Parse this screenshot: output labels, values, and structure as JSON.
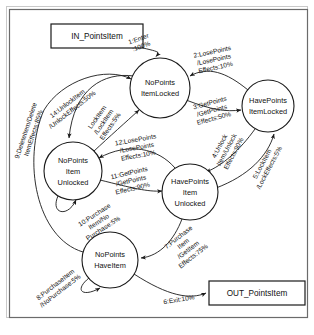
{
  "diagram": {
    "type": "state-machine",
    "frame": {
      "border_color": "#6b6b6b",
      "background": "#ffffff"
    },
    "terminals": [
      {
        "id": "in",
        "label": "IN_PointsItem",
        "x": 97,
        "y": 36,
        "w": 92,
        "h": 24
      },
      {
        "id": "out",
        "label": "OUT_PointsItem",
        "x": 257,
        "y": 293,
        "w": 96,
        "h": 24
      }
    ],
    "states": [
      {
        "id": "s_np_locked",
        "lines": [
          "NoPoints",
          "ItemLocked"
        ],
        "cx": 160,
        "cy": 88,
        "r": 30
      },
      {
        "id": "s_hp_locked",
        "lines": [
          "HavePoints",
          "ItemLocked"
        ],
        "cx": 268,
        "cy": 106,
        "r": 26
      },
      {
        "id": "s_np_unlocked",
        "lines": [
          "NoPoints",
          "Item",
          "Unlocked"
        ],
        "cx": 73,
        "cy": 171,
        "r": 29
      },
      {
        "id": "s_hp_unlocked",
        "lines": [
          "HavePoints",
          "Item",
          "Unlocked"
        ],
        "cx": 190,
        "cy": 192,
        "r": 28
      },
      {
        "id": "s_np_haveitem",
        "lines": [
          "NoPoints",
          "HaveItem"
        ],
        "cx": 110,
        "cy": 260,
        "r": 28
      }
    ],
    "transitions": [
      {
        "id": "t1",
        "number": "1",
        "from": "in",
        "to": "s_np_locked",
        "lines": [
          "1:Enter",
          ":100%"
        ],
        "label_x": 140,
        "label_y": 43,
        "rotation": -20,
        "trigger": "Enter",
        "probability": "100%"
      },
      {
        "id": "t2",
        "number": "2",
        "from": "s_hp_locked",
        "to": "s_np_locked",
        "lines": [
          "2:LosePoints",
          "/LosePoints",
          "Effects:10%"
        ],
        "label_x": 214,
        "label_y": 60,
        "rotation": -12,
        "trigger": "LosePoints",
        "action": "LosePoints",
        "probability": "10%"
      },
      {
        "id": "t3",
        "number": "3",
        "from": "s_np_locked",
        "to": "s_hp_locked",
        "lines": [
          "3:GetPoints",
          "/GetPoints",
          "Effects:50%"
        ],
        "label_x": 214,
        "label_y": 110,
        "rotation": -15,
        "trigger": "GetPoints",
        "action": "GetPoints",
        "probability": "50%"
      },
      {
        "id": "t4",
        "number": "4",
        "from": "s_hp_locked",
        "to": "s_hp_unlocked",
        "lines": [
          "4:Unlock",
          "Item/Unlock",
          "Effects:90%"
        ],
        "label_x": 224,
        "label_y": 150,
        "rotation": -62,
        "trigger": "UnlockItem",
        "action": "Unlock",
        "probability": "90%"
      },
      {
        "id": "t5",
        "number": "5",
        "from": "s_hp_unlocked",
        "to": "s_hp_locked",
        "lines": [
          "5:LockItem",
          "/LockEffects:5%"
        ],
        "label_x": 266,
        "label_y": 166,
        "rotation": -62,
        "trigger": "LockItem",
        "action": "Lock",
        "probability": "5%"
      },
      {
        "id": "t6",
        "number": "6",
        "from": "s_np_haveitem",
        "to": "out",
        "lines": [
          "6:Exit:10%"
        ],
        "label_x": 179,
        "label_y": 300,
        "rotation": -9,
        "trigger": "Exit",
        "probability": "10%"
      },
      {
        "id": "t7",
        "number": "7",
        "from": "s_hp_unlocked",
        "to": "s_np_haveitem",
        "lines": [
          "7:Purchase",
          "Item",
          "/GetItem",
          "Effects:75%"
        ],
        "label_x": 183,
        "label_y": 248,
        "rotation": -38,
        "trigger": "PurchaseItem",
        "action": "GetItem",
        "probability": "75%"
      },
      {
        "id": "t8",
        "number": "8",
        "from": "s_np_haveitem",
        "to": "s_np_haveitem",
        "lines": [
          "8:PurchaseItem",
          "/NoPurchase:5%"
        ],
        "label_x": 58,
        "label_y": 288,
        "rotation": -38,
        "trigger": "PurchaseItem",
        "action": "NoPurchase",
        "probability": "5%"
      },
      {
        "id": "t9",
        "number": "9",
        "from": "s_np_haveitem",
        "to": "s_np_locked",
        "lines": [
          "9:DeleteItem/Delete",
          "ItemEffects:85%"
        ],
        "label_x": 28,
        "label_y": 132,
        "rotation": -72,
        "trigger": "DeleteItem",
        "action": "DeleteItem",
        "probability": "85%"
      },
      {
        "id": "t10",
        "number": "10",
        "from": "s_np_unlocked",
        "to": "s_np_unlocked",
        "lines": [
          "10:Purchase",
          "Item/No",
          "Purchase:5%"
        ],
        "label_x": 98,
        "label_y": 222,
        "rotation": -33,
        "trigger": "PurchaseItem",
        "action": "NoPurchase",
        "probability": "5%"
      },
      {
        "id": "t11",
        "number": "11",
        "from": "s_np_unlocked",
        "to": "s_hp_unlocked",
        "lines": [
          "11:GetPoints",
          "/GetPoints",
          "Effects:90%"
        ],
        "label_x": 131,
        "label_y": 180,
        "rotation": -13,
        "trigger": "GetPoints",
        "action": "GetPoints",
        "probability": "90%"
      },
      {
        "id": "t12",
        "number": "12",
        "from": "s_hp_unlocked",
        "to": "s_np_unlocked",
        "lines": [
          "12:LosePoints",
          "/LosePoints",
          "Effects:10%"
        ],
        "label_x": 136,
        "label_y": 148,
        "rotation": -10,
        "trigger": "LosePoints",
        "action": "LosePoints",
        "probability": "10%"
      },
      {
        "id": "t13",
        "number": "13",
        "from": "s_np_unlocked",
        "to": "s_np_locked",
        "lines": [
          "LockItem",
          "/LockItem",
          "Effects:5%"
        ],
        "label_x": 102,
        "label_y": 122,
        "rotation": -58,
        "trigger": "LockItem",
        "action": "LockItem",
        "probability": "5%"
      },
      {
        "id": "t14",
        "number": "14",
        "from": "s_np_locked",
        "to": "s_np_unlocked",
        "lines": [
          "14:UnlockItem",
          "/UnlockEffects:50%"
        ],
        "label_x": 72,
        "label_y": 108,
        "rotation": -38,
        "trigger": "UnlockItem",
        "action": "Unlock",
        "probability": "50%"
      }
    ]
  }
}
